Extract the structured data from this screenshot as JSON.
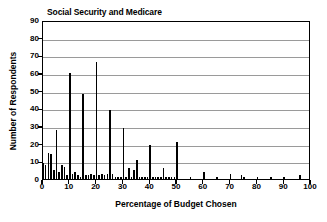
{
  "chart_data": {
    "type": "bar",
    "title": "Social Security and Medicare",
    "xlabel": "Percentage of Budget Chosen",
    "ylabel": "Number of Respondents",
    "xlim": [
      0,
      100
    ],
    "ylim": [
      0,
      90
    ],
    "xticks": [
      0,
      10,
      20,
      30,
      40,
      50,
      60,
      70,
      80,
      90,
      100
    ],
    "yticks": [
      0,
      10,
      20,
      30,
      40,
      50,
      60,
      70,
      80,
      90
    ],
    "grid": "horizontal",
    "legend": null,
    "bar_color": "#000000",
    "x": [
      0,
      1,
      2,
      3,
      4,
      5,
      6,
      7,
      8,
      9,
      10,
      11,
      12,
      13,
      14,
      15,
      16,
      17,
      18,
      19,
      20,
      21,
      22,
      23,
      24,
      25,
      26,
      27,
      28,
      29,
      30,
      31,
      32,
      33,
      34,
      35,
      36,
      37,
      38,
      39,
      40,
      41,
      42,
      43,
      44,
      45,
      46,
      47,
      48,
      49,
      50,
      51,
      52,
      53,
      54,
      55,
      56,
      57,
      58,
      59,
      60,
      61,
      62,
      63,
      64,
      65,
      66,
      67,
      68,
      69,
      70,
      71,
      72,
      73,
      74,
      75,
      76,
      77,
      78,
      79,
      80,
      81,
      82,
      83,
      84,
      85,
      86,
      87,
      88,
      89,
      90,
      91,
      92,
      93,
      94,
      95,
      96,
      97,
      98,
      99,
      100
    ],
    "values": [
      9,
      8,
      15,
      14,
      5,
      28,
      4,
      8,
      7,
      2,
      60,
      3,
      4,
      2,
      1,
      48,
      2,
      2,
      3,
      2,
      66,
      2,
      3,
      2,
      3,
      39,
      3,
      1,
      1,
      1,
      29,
      1,
      6,
      1,
      5,
      11,
      1,
      1,
      1,
      1,
      19,
      1,
      1,
      1,
      1,
      6,
      1,
      1,
      1,
      1,
      21,
      0,
      0,
      0,
      0,
      1,
      0,
      0,
      0,
      0,
      4,
      0,
      0,
      0,
      0,
      1,
      0,
      0,
      0,
      0,
      3,
      0,
      0,
      0,
      2,
      1,
      0,
      0,
      0,
      0,
      1,
      0,
      0,
      0,
      0,
      1,
      0,
      0,
      0,
      0,
      1,
      0,
      0,
      0,
      0,
      0,
      2,
      0,
      0,
      0,
      0
    ]
  }
}
